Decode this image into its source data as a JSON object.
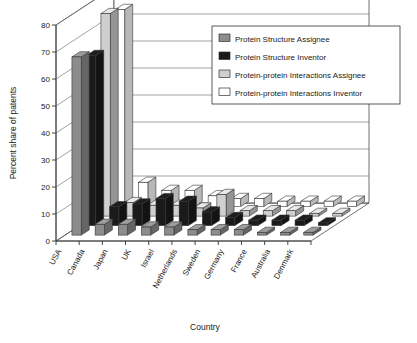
{
  "chart_data": {
    "type": "bar",
    "title": "",
    "subtitle": "",
    "xlabel": "Country",
    "ylabel": "Percent share of patents",
    "ylim": [
      0,
      80
    ],
    "yticks": [
      0,
      10,
      20,
      30,
      40,
      50,
      60,
      70,
      80
    ],
    "grid": true,
    "projection": "3d-grouped-bars",
    "legend_position": "top-right-inside",
    "categories": [
      "USA",
      "Canada",
      "Japan",
      "UK",
      "Israel",
      "Netherlands",
      "Sweden",
      "Germany",
      "France",
      "Australia",
      "Denmark"
    ],
    "series": [
      {
        "name": "Protein Structure Assignee",
        "color": "#8c8c8c",
        "values": [
          66,
          4,
          4,
          3,
          3,
          2,
          2,
          2,
          1,
          1,
          1
        ]
      },
      {
        "name": "Protein Structure Inventor",
        "color": "#1a1a1a",
        "values": [
          63,
          7,
          8,
          10,
          9,
          5,
          3,
          2,
          2,
          2,
          1
        ]
      },
      {
        "name": "Protein-protein Interactions Assignee",
        "color": "#cfcfcf",
        "values": [
          75,
          5,
          4,
          4,
          3,
          8,
          2,
          2,
          2,
          1,
          1
        ]
      },
      {
        "name": "Protein-protein Interactions Inventor",
        "color": "#ffffff",
        "values": [
          73,
          9,
          6,
          6,
          4,
          3,
          3,
          2,
          2,
          2,
          2
        ]
      }
    ]
  },
  "legend": {
    "items": [
      {
        "label": "Protein Structure Assignee"
      },
      {
        "label": "Protein Structure Inventor"
      },
      {
        "label": "Protein-protein Interactions Assignee"
      },
      {
        "label": "Protein-protein Interactions Inventor"
      }
    ]
  }
}
